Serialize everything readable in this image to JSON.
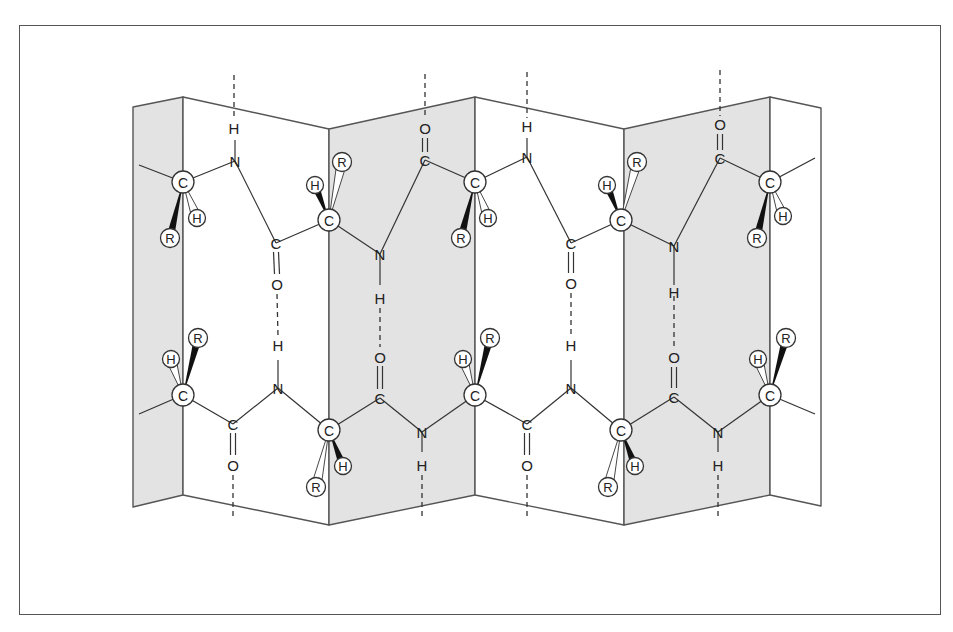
{
  "figure": {
    "colors": {
      "shade": "#e3e3e3",
      "line": "#555555",
      "bond": "#333333",
      "wedge": "#111111"
    },
    "panels": [
      {
        "x1": 133,
        "x2": 183,
        "top1": 107,
        "top2": 97,
        "bot1": 507,
        "bot2": 495,
        "shaded": true
      },
      {
        "x1": 183,
        "x2": 329,
        "top1": 97,
        "top2": 129,
        "bot1": 495,
        "bot2": 525,
        "shaded": false
      },
      {
        "x1": 329,
        "x2": 475,
        "top1": 129,
        "top2": 97,
        "bot1": 525,
        "bot2": 495,
        "shaded": true
      },
      {
        "x1": 475,
        "x2": 624,
        "top1": 97,
        "top2": 129,
        "bot1": 495,
        "bot2": 525,
        "shaded": false
      },
      {
        "x1": 624,
        "x2": 770,
        "top1": 129,
        "top2": 97,
        "bot1": 525,
        "bot2": 495,
        "shaded": true
      },
      {
        "x1": 770,
        "x2": 821,
        "top1": 97,
        "top2": 108,
        "bot1": 495,
        "bot2": 506,
        "shaded": false
      }
    ],
    "bonds": [
      [
        139,
        165,
        183,
        182
      ],
      [
        183,
        182,
        235,
        161
      ],
      [
        235,
        161,
        276,
        243
      ],
      [
        276,
        243,
        329,
        220
      ],
      [
        329,
        220,
        380,
        254
      ],
      [
        380,
        254,
        425,
        160
      ],
      [
        425,
        160,
        475,
        182
      ],
      [
        475,
        182,
        527,
        157
      ],
      [
        527,
        157,
        571,
        243
      ],
      [
        571,
        243,
        621,
        220
      ],
      [
        621,
        220,
        674,
        246
      ],
      [
        674,
        246,
        720,
        158
      ],
      [
        720,
        158,
        770,
        182
      ],
      [
        770,
        182,
        815,
        158
      ],
      [
        139,
        414,
        183,
        395
      ],
      [
        183,
        395,
        233,
        424
      ],
      [
        233,
        424,
        278,
        388
      ],
      [
        278,
        388,
        329,
        430
      ],
      [
        329,
        430,
        380,
        398
      ],
      [
        380,
        398,
        422,
        432
      ],
      [
        422,
        432,
        475,
        395
      ],
      [
        475,
        395,
        527,
        424
      ],
      [
        527,
        424,
        571,
        388
      ],
      [
        571,
        388,
        621,
        430
      ],
      [
        621,
        430,
        674,
        397
      ],
      [
        674,
        397,
        718,
        432
      ],
      [
        718,
        432,
        770,
        395
      ],
      [
        770,
        395,
        815,
        414
      ],
      [
        235,
        161,
        235,
        140
      ],
      [
        380,
        254,
        380,
        285
      ],
      [
        527,
        157,
        527,
        138
      ],
      [
        674,
        246,
        674,
        285
      ],
      [
        278,
        388,
        278,
        360
      ],
      [
        422,
        432,
        422,
        452
      ],
      [
        571,
        388,
        571,
        360
      ],
      [
        718,
        432,
        718,
        452
      ]
    ],
    "double_bonds": [
      [
        276,
        252,
        277,
        274
      ],
      [
        425,
        138,
        425,
        152
      ],
      [
        571,
        252,
        571,
        273
      ],
      [
        720,
        134,
        720,
        150
      ],
      [
        233,
        433,
        233,
        455
      ],
      [
        380,
        366,
        380,
        389
      ],
      [
        527,
        433,
        527,
        455
      ],
      [
        674,
        367,
        674,
        388
      ]
    ],
    "dashes": [
      [
        234,
        75,
        234,
        120
      ],
      [
        425,
        74,
        425,
        119
      ],
      [
        527,
        72,
        527,
        118
      ],
      [
        720,
        70,
        720,
        116
      ],
      [
        277,
        294,
        278,
        336
      ],
      [
        380,
        308,
        380,
        347
      ],
      [
        571,
        293,
        571,
        336
      ],
      [
        674,
        296,
        674,
        347
      ],
      [
        233,
        475,
        233,
        516
      ],
      [
        422,
        475,
        422,
        516
      ],
      [
        527,
        475,
        527,
        516
      ],
      [
        718,
        475,
        718,
        516
      ]
    ],
    "atoms": [
      {
        "t": "H",
        "x": 234,
        "y": 128
      },
      {
        "t": "N",
        "x": 235,
        "y": 161
      },
      {
        "t": "C",
        "x": 276,
        "y": 243
      },
      {
        "t": "O",
        "x": 277,
        "y": 284
      },
      {
        "t": "O",
        "x": 425,
        "y": 128
      },
      {
        "t": "C",
        "x": 425,
        "y": 160
      },
      {
        "t": "N",
        "x": 380,
        "y": 254
      },
      {
        "t": "H",
        "x": 380,
        "y": 298
      },
      {
        "t": "H",
        "x": 527,
        "y": 126
      },
      {
        "t": "N",
        "x": 527,
        "y": 157
      },
      {
        "t": "C",
        "x": 571,
        "y": 243
      },
      {
        "t": "O",
        "x": 571,
        "y": 283
      },
      {
        "t": "O",
        "x": 720,
        "y": 124
      },
      {
        "t": "C",
        "x": 720,
        "y": 158
      },
      {
        "t": "N",
        "x": 674,
        "y": 246
      },
      {
        "t": "H",
        "x": 674,
        "y": 292
      },
      {
        "t": "H",
        "x": 278,
        "y": 345
      },
      {
        "t": "N",
        "x": 278,
        "y": 388
      },
      {
        "t": "C",
        "x": 233,
        "y": 424
      },
      {
        "t": "O",
        "x": 233,
        "y": 465
      },
      {
        "t": "O",
        "x": 380,
        "y": 357
      },
      {
        "t": "C",
        "x": 380,
        "y": 398
      },
      {
        "t": "N",
        "x": 422,
        "y": 432
      },
      {
        "t": "H",
        "x": 422,
        "y": 465
      },
      {
        "t": "H",
        "x": 571,
        "y": 345
      },
      {
        "t": "N",
        "x": 571,
        "y": 388
      },
      {
        "t": "C",
        "x": 527,
        "y": 424
      },
      {
        "t": "O",
        "x": 527,
        "y": 465
      },
      {
        "t": "O",
        "x": 674,
        "y": 357
      },
      {
        "t": "C",
        "x": 674,
        "y": 397
      },
      {
        "t": "N",
        "x": 718,
        "y": 432
      },
      {
        "t": "H",
        "x": 718,
        "y": 465
      }
    ],
    "alpha_carbons": [
      {
        "c": [
          183,
          182
        ],
        "h": [
          197,
          218
        ],
        "r": [
          170,
          238
        ],
        "wedge": "r",
        "hatch": "h"
      },
      {
        "c": [
          329,
          220
        ],
        "h": [
          315,
          185
        ],
        "r": [
          342,
          162
        ],
        "wedge": "h",
        "hatch": "r"
      },
      {
        "c": [
          475,
          182
        ],
        "h": [
          488,
          218
        ],
        "r": [
          461,
          238
        ],
        "wedge": "r",
        "hatch": "h"
      },
      {
        "c": [
          621,
          220
        ],
        "h": [
          607,
          185
        ],
        "r": [
          637,
          162
        ],
        "wedge": "h",
        "hatch": "r"
      },
      {
        "c": [
          770,
          182
        ],
        "h": [
          783,
          216
        ],
        "r": [
          757,
          238
        ],
        "wedge": "r",
        "hatch": "h"
      },
      {
        "c": [
          183,
          395
        ],
        "h": [
          171,
          359
        ],
        "r": [
          198,
          338
        ],
        "wedge": "r",
        "hatch": "h"
      },
      {
        "c": [
          329,
          430
        ],
        "h": [
          343,
          466
        ],
        "r": [
          316,
          487
        ],
        "wedge": "h",
        "hatch": "r"
      },
      {
        "c": [
          475,
          395
        ],
        "h": [
          463,
          359
        ],
        "r": [
          490,
          338
        ],
        "wedge": "r",
        "hatch": "h"
      },
      {
        "c": [
          621,
          430
        ],
        "h": [
          635,
          466
        ],
        "r": [
          608,
          487
        ],
        "wedge": "h",
        "hatch": "r"
      },
      {
        "c": [
          770,
          395
        ],
        "h": [
          758,
          359
        ],
        "r": [
          786,
          338
        ],
        "wedge": "r",
        "hatch": "h"
      }
    ],
    "labels": {
      "carbon": "C",
      "hydrogen": "H",
      "r_group": "R"
    }
  }
}
